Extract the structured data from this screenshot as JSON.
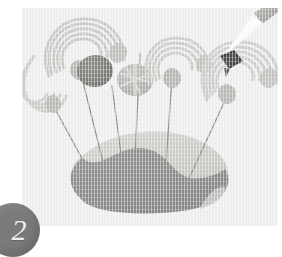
{
  "figure": {
    "step_number": "2",
    "caption": "",
    "panel_background": "#eceded",
    "badge_color": "#7a7a7a",
    "badge_text_color": "#efefef"
  },
  "palette": {
    "panel_bg": "#eceded",
    "blob_light": "#c9cac6",
    "blob_dark": "#8c8d89",
    "pin_wire": "#9a9b98",
    "swirl_light": "#d5d6d3",
    "swirl_stripe": "#bcbdba",
    "disc_dark": "#7b7a76",
    "disc_mid": "#b2b3af",
    "tool_body": "#a9aaa6",
    "specimen_dark": "#3c3c3c"
  },
  "scene": {
    "title": "pinned-specimen-diagram",
    "elements": [
      {
        "name": "rock-blob",
        "label": "substrate"
      },
      {
        "name": "pin-1",
        "label": "pin"
      },
      {
        "name": "pin-2",
        "label": "pin"
      },
      {
        "name": "pin-3",
        "label": "pin"
      },
      {
        "name": "pin-4",
        "label": "pin"
      },
      {
        "name": "pin-5",
        "label": "pin"
      },
      {
        "name": "pin-6",
        "label": "pin"
      },
      {
        "name": "swirl-specimen-left",
        "label": "hook specimen"
      },
      {
        "name": "swirl-specimen-upper-left",
        "label": "hook specimen"
      },
      {
        "name": "disc-specimen-dark",
        "label": "dark disc specimen"
      },
      {
        "name": "disc-specimen-striped",
        "label": "striped disc specimen"
      },
      {
        "name": "swirl-specimen-center",
        "label": "hook specimen"
      },
      {
        "name": "swirl-specimen-right",
        "label": "hook specimen"
      },
      {
        "name": "tweezers-tool",
        "label": "tweezers"
      },
      {
        "name": "held-specimen",
        "label": "specimen in tweezers"
      }
    ]
  }
}
